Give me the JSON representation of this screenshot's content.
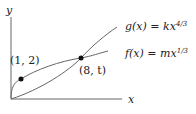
{
  "diagram": {
    "axes": {
      "x_label": "x",
      "y_label": "y"
    },
    "curves": [
      {
        "name": "g",
        "label_lhs": "g(x) = kx",
        "exponent": "4/3"
      },
      {
        "name": "f",
        "label_lhs": "f(x) = mx",
        "exponent": "1/3"
      }
    ],
    "points": [
      {
        "label": "(1, 2)"
      },
      {
        "label": "(8, t)"
      }
    ],
    "colors": {
      "curve": "#555555",
      "axis": "#555555",
      "point": "#111111"
    }
  }
}
